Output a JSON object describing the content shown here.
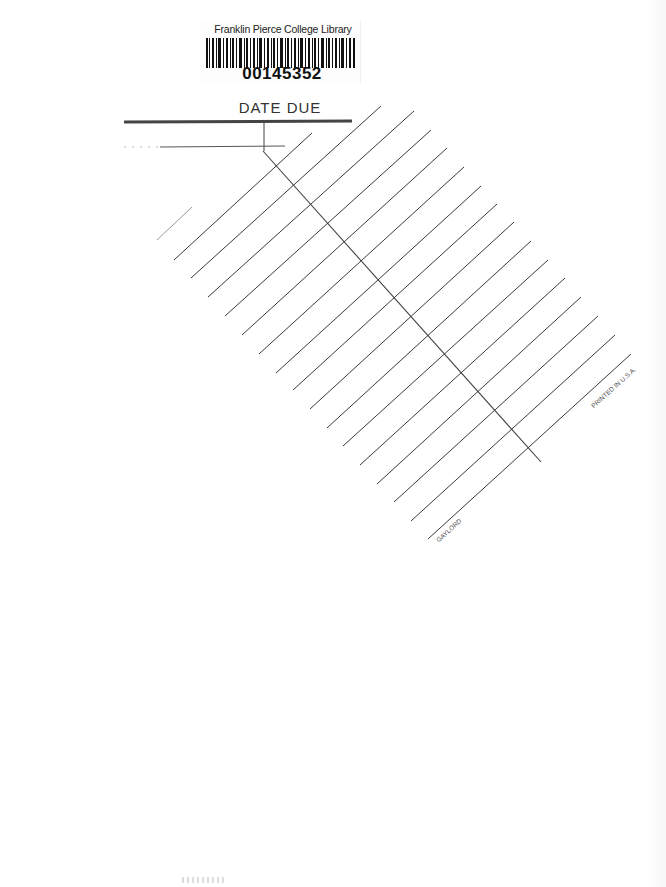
{
  "barcode_label": {
    "library_name": "Franklin Pierce College Library",
    "barcode_number": "00145352"
  },
  "date_due_card": {
    "title": "DATE DUE",
    "manufacturer_imprint": "GAYLORD",
    "origin_imprint": "PRINTED IN U.S.A.",
    "line_color": "#3a3a3a",
    "rule_count": 20
  },
  "colors": {
    "background": "#ffffff",
    "ink": "#222222"
  }
}
